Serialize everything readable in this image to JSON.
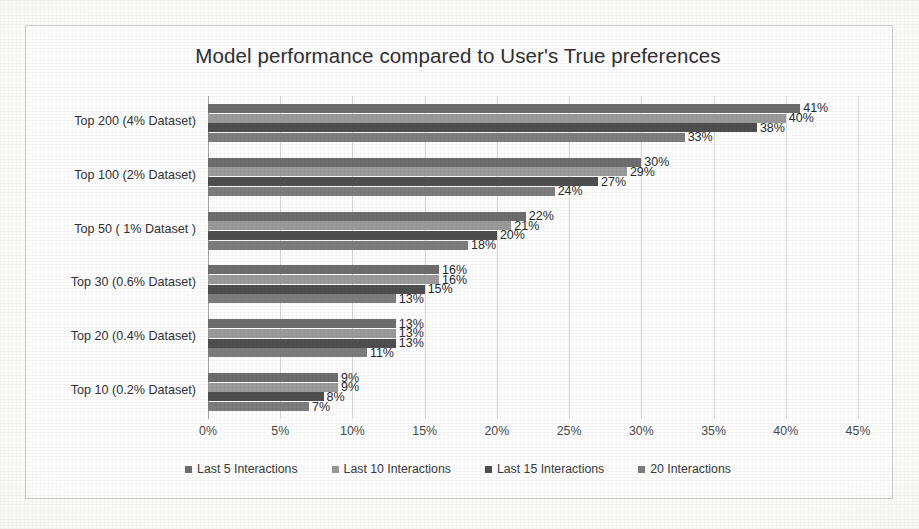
{
  "chart_data": {
    "type": "bar",
    "orientation": "horizontal",
    "title": "Model performance compared to User's True preferences",
    "xlabel": "",
    "ylabel": "",
    "xlim": [
      0,
      45
    ],
    "xticks": [
      "0%",
      "5%",
      "10%",
      "15%",
      "20%",
      "25%",
      "30%",
      "35%",
      "40%",
      "45%"
    ],
    "xtick_values": [
      0,
      5,
      10,
      15,
      20,
      25,
      30,
      35,
      40,
      45
    ],
    "grid": true,
    "legend_position": "bottom",
    "value_suffix": "%",
    "categories": [
      "Top 200 (4% Dataset)",
      "Top 100 (2% Dataset)",
      "Top 50 ( 1% Dataset )",
      "Top 30 (0.6% Dataset)",
      "Top 20 (0.4% Dataset)",
      "Top 10 (0.2% Dataset)"
    ],
    "series": [
      {
        "name": "Last 5 Interactions",
        "color": "#6e6e6e",
        "values": [
          41,
          30,
          22,
          16,
          13,
          9
        ],
        "labels": [
          "41%",
          "30%",
          "22%",
          "16%",
          "13%",
          "9%"
        ]
      },
      {
        "name": "Last 10 Interactions",
        "color": "#9a9a9a",
        "values": [
          40,
          29,
          21,
          16,
          13,
          9
        ],
        "labels": [
          "40%",
          "29%",
          "21%",
          "16%",
          "13%",
          "9%"
        ]
      },
      {
        "name": "Last 15 Interactions",
        "color": "#4f4f4f",
        "values": [
          38,
          27,
          20,
          15,
          13,
          8
        ],
        "labels": [
          "38%",
          "27%",
          "20%",
          "15%",
          "13%",
          "8%"
        ]
      },
      {
        "name": "20 Interactions",
        "color": "#7d7d7d",
        "values": [
          33,
          24,
          18,
          13,
          11,
          7
        ],
        "labels": [
          "33%",
          "24%",
          "18%",
          "13%",
          "11%",
          "7%"
        ]
      }
    ]
  }
}
